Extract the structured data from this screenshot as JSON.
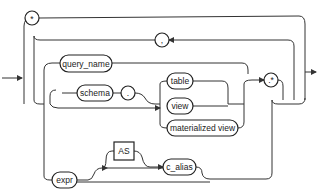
{
  "diagram": {
    "type": "railroad-syntax-diagram",
    "nodes": {
      "star": "*",
      "comma_loop": ",",
      "query_name": "query_name",
      "schema": "schema",
      "dot": ".",
      "table": "table",
      "view": "view",
      "materialized_view": "materialized view",
      "dot_star": ".*",
      "expr": "expr",
      "as": "AS",
      "c_alias": "c_alias"
    },
    "colors": {
      "line": "#333333",
      "node_fill": "#ffffff",
      "text": "#222222"
    }
  }
}
